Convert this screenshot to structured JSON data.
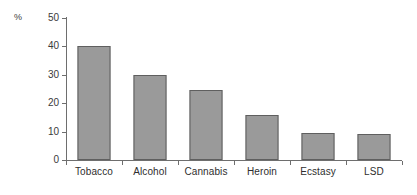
{
  "chart_data": {
    "type": "bar",
    "title": "",
    "subtitle": "",
    "xlabel": "",
    "ylabel": "%",
    "unit_label": "%",
    "categories": [
      "Tobacco",
      "Alcohol",
      "Cannabis",
      "Heroin",
      "Ecstasy",
      "LSD"
    ],
    "values": [
      40,
      30,
      24.5,
      16,
      9.5,
      9
    ],
    "ylim": [
      0,
      50
    ],
    "ytick_values": [
      0,
      10,
      20,
      30,
      40,
      50
    ],
    "ytick_labels": [
      "0",
      "10",
      "20",
      "30",
      "40",
      "50"
    ],
    "grid": false,
    "legend": false,
    "legend_position": "none",
    "annotations": [],
    "colors": {
      "bar_fill": "#9a9a9a",
      "bar_edge": "#5f5f5f",
      "axis": "#6e6e6e",
      "text": "#2e2e2e",
      "background": "#ffffff"
    }
  }
}
